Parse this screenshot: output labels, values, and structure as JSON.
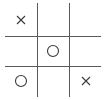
{
  "game": "tic-tac-toe",
  "colors": {
    "grid": "#5a5a5a",
    "mark": "#3a3a3a"
  },
  "board": [
    [
      "X",
      "",
      ""
    ],
    [
      "",
      "O",
      ""
    ],
    [
      "O",
      "",
      "X"
    ]
  ],
  "cells": [
    {
      "row": 0,
      "col": 0,
      "mark": "X"
    },
    {
      "row": 0,
      "col": 1,
      "mark": ""
    },
    {
      "row": 0,
      "col": 2,
      "mark": ""
    },
    {
      "row": 1,
      "col": 0,
      "mark": ""
    },
    {
      "row": 1,
      "col": 1,
      "mark": "O"
    },
    {
      "row": 1,
      "col": 2,
      "mark": ""
    },
    {
      "row": 2,
      "col": 0,
      "mark": "O"
    },
    {
      "row": 2,
      "col": 1,
      "mark": ""
    },
    {
      "row": 2,
      "col": 2,
      "mark": "X"
    }
  ]
}
